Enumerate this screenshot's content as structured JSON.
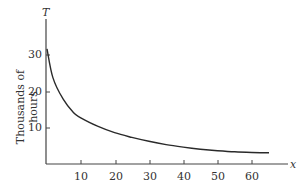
{
  "chart_data": {
    "type": "line",
    "title": "",
    "xlabel": "x",
    "ylabel": "Thousands of hours",
    "yaxis_symbol": "T",
    "xlim": [
      0,
      70
    ],
    "ylim": [
      0,
      35
    ],
    "xticks": [
      10,
      20,
      30,
      40,
      50,
      60
    ],
    "yticks": [
      10,
      20,
      30
    ],
    "grid": false,
    "legend": null,
    "series": [
      {
        "name": "T(x)",
        "x": [
          0.3,
          2,
          5,
          8,
          10,
          15,
          20,
          25,
          30,
          35,
          40,
          45,
          50,
          55,
          60,
          65
        ],
        "y": [
          32,
          24,
          18,
          14.3,
          12.9,
          10.5,
          8.7,
          7.4,
          6.3,
          5.4,
          4.7,
          4.1,
          3.7,
          3.4,
          3.2,
          3.1
        ]
      }
    ],
    "color": "#2a2a2a"
  },
  "labels": {
    "y_symbol": "T",
    "x_symbol": "x",
    "y_title": "Thousands of hours",
    "yticks": [
      "10",
      "20",
      "30"
    ],
    "xticks": [
      "10",
      "20",
      "30",
      "40",
      "50",
      "60"
    ]
  }
}
